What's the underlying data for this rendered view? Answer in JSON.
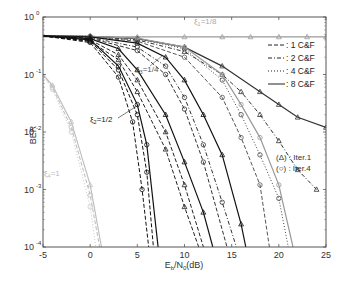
{
  "chart_data": {
    "type": "line",
    "title": "",
    "xlabel": "E_b/N_0(dB)",
    "ylabel": "BER",
    "xlim": [
      -5,
      25
    ],
    "ylim": [
      0.0001,
      1
    ],
    "yscale": "log",
    "grid": false,
    "x_ticks": [
      -5,
      0,
      5,
      10,
      15,
      20,
      25
    ],
    "x_tick_labels": [
      "-5",
      "0",
      "5",
      "10",
      "15",
      "20",
      "25"
    ],
    "y_ticks": [
      1,
      0.1,
      0.01,
      0.001,
      0.0001
    ],
    "y_tick_labels": [
      {
        "base": "10",
        "exp": "0"
      },
      {
        "base": "10",
        "exp": "-1"
      },
      {
        "base": "10",
        "exp": "-2"
      },
      {
        "base": "10",
        "exp": "-3"
      },
      {
        "base": "10",
        "exp": "-4"
      }
    ],
    "legend": {
      "position": "right",
      "entries": [
        {
          "style": "dashed",
          "label": ": 1 C&F"
        },
        {
          "style": "dashdot",
          "label": ": 2 C&F"
        },
        {
          "style": "dotted",
          "label": ": 4 C&F"
        },
        {
          "style": "solid",
          "label": ": 8 C&F"
        }
      ]
    },
    "marker_legend": [
      {
        "marker": "triangle",
        "label": "(Δ) : Iter.1"
      },
      {
        "marker": "circle",
        "label": "(○) : Iter.4"
      }
    ],
    "annotations": [
      {
        "text": "ξ",
        "sub": "1",
        "rest": "=1/8",
        "color": "#aaaaaa"
      },
      {
        "text": "ξ",
        "sub": "3",
        "rest": "=1/4",
        "color": "#555555"
      },
      {
        "text": "ξ",
        "sub": "2",
        "rest": "=1/2",
        "color": "#222222"
      },
      {
        "text": "ξ",
        "sub": "4",
        "rest": "=1",
        "color": "#bbbbbb"
      }
    ],
    "series": [
      {
        "name": "xi1=1/8 all C&F (error floor)",
        "color": "#999999",
        "style": "solid",
        "marker": "triangle",
        "x": [
          -5,
          0,
          5,
          10,
          14,
          17,
          20,
          23,
          25
        ],
        "y": [
          0.45,
          0.45,
          0.45,
          0.45,
          0.45,
          0.45,
          0.45,
          0.45,
          0.45
        ]
      },
      {
        "name": "xi1=1/8 8C&F Iter1",
        "color": "#333333",
        "style": "solid",
        "marker": "triangle",
        "x": [
          -5,
          0,
          5,
          10,
          14,
          18,
          20,
          22,
          25
        ],
        "y": [
          0.47,
          0.46,
          0.42,
          0.3,
          0.14,
          0.05,
          0.03,
          0.018,
          0.012
        ]
      },
      {
        "name": "xi1=1/8 2C&F Iter1",
        "color": "#333333",
        "style": "dashdot",
        "marker": "triangle",
        "x": [
          -5,
          0,
          5,
          10,
          14,
          16,
          18,
          20,
          22,
          24
        ],
        "y": [
          0.47,
          0.46,
          0.4,
          0.25,
          0.1,
          0.05,
          0.02,
          0.007,
          0.0022,
          0.001
        ]
      },
      {
        "name": "xi1=1/8 4C&F Iter4",
        "color": "#444444",
        "style": "dotted",
        "marker": "circle",
        "x": [
          -5,
          0,
          5,
          10,
          14,
          16,
          18,
          20,
          21
        ],
        "y": [
          0.47,
          0.46,
          0.42,
          0.28,
          0.08,
          0.02,
          0.004,
          0.0007,
          0.0001
        ]
      },
      {
        "name": "xi1=1/8 1C&F Iter4",
        "color": "#555555",
        "style": "dashed",
        "marker": "circle",
        "x": [
          -5,
          0,
          5,
          10,
          14,
          16,
          18,
          19
        ],
        "y": [
          0.47,
          0.45,
          0.38,
          0.2,
          0.04,
          0.008,
          0.0012,
          0.0001
        ]
      },
      {
        "name": "xi1=1/8 8C&F Iter4",
        "color": "#999999",
        "style": "solid",
        "marker": "circle",
        "x": [
          -5,
          0,
          5,
          10,
          14,
          16,
          18,
          20,
          21.5
        ],
        "y": [
          0.47,
          0.46,
          0.43,
          0.3,
          0.1,
          0.03,
          0.008,
          0.0012,
          0.0001
        ]
      },
      {
        "name": "xi3=1/4 8C&F",
        "color": "#111111",
        "style": "solid",
        "marker": "triangle",
        "x": [
          -5,
          0,
          5,
          8,
          10,
          12,
          14,
          16,
          16.5
        ],
        "y": [
          0.47,
          0.45,
          0.35,
          0.2,
          0.08,
          0.02,
          0.004,
          0.00025,
          0.0001
        ]
      },
      {
        "name": "xi3=1/4 2C&F",
        "color": "#333333",
        "style": "dashdot",
        "marker": "circle",
        "x": [
          -5,
          0,
          5,
          8,
          10,
          12,
          14,
          15.5
        ],
        "y": [
          0.47,
          0.44,
          0.3,
          0.14,
          0.04,
          0.006,
          0.0006,
          0.0001
        ]
      },
      {
        "name": "xi3=1/4 1C&F",
        "color": "#333333",
        "style": "dashed",
        "marker": "circle",
        "x": [
          -5,
          0,
          5,
          8,
          10,
          12,
          14.5
        ],
        "y": [
          0.47,
          0.43,
          0.26,
          0.1,
          0.025,
          0.003,
          0.0001
        ]
      },
      {
        "name": "xi2=1/2 8C&F",
        "color": "#111111",
        "style": "solid",
        "marker": "triangle",
        "x": [
          -5,
          0,
          3,
          5,
          8,
          10,
          12,
          13
        ],
        "y": [
          0.47,
          0.42,
          0.28,
          0.12,
          0.02,
          0.003,
          0.0004,
          0.0001
        ]
      },
      {
        "name": "xi2=1/2 2C&F",
        "color": "#222222",
        "style": "dashed",
        "marker": "triangle",
        "x": [
          -5,
          0,
          3,
          5,
          8,
          10,
          12
        ],
        "y": [
          0.47,
          0.4,
          0.22,
          0.08,
          0.01,
          0.0012,
          0.0001
        ]
      },
      {
        "name": "xi2=1/2 1C&F",
        "color": "#222222",
        "style": "dashed",
        "marker": "triangle",
        "x": [
          -5,
          0,
          3,
          5,
          8,
          10,
          11.5
        ],
        "y": [
          0.47,
          0.38,
          0.18,
          0.05,
          0.005,
          0.0005,
          0.0001
        ]
      },
      {
        "name": "xi2=1/2 8C&F Iter4",
        "color": "#111111",
        "style": "solid",
        "marker": "circle",
        "x": [
          -5,
          0,
          3,
          5,
          6,
          7.2
        ],
        "y": [
          0.47,
          0.4,
          0.14,
          0.03,
          0.006,
          0.0001
        ]
      },
      {
        "name": "xi2=1/2 2C&F Iter4",
        "color": "#111111",
        "style": "dashed",
        "marker": "circle",
        "x": [
          -5,
          0,
          3,
          5,
          6,
          6.7
        ],
        "y": [
          0.47,
          0.38,
          0.12,
          0.02,
          0.002,
          0.0001
        ]
      },
      {
        "name": "xi2=1/2 1C&F Iter4",
        "color": "#111111",
        "style": "dashed",
        "marker": "circle",
        "x": [
          -5,
          0,
          3,
          4.5,
          5.5,
          6.2
        ],
        "y": [
          0.47,
          0.36,
          0.09,
          0.015,
          0.001,
          0.0001
        ]
      },
      {
        "name": "xi4=1 curves",
        "color": "#bbbbbb",
        "style": "dashed",
        "marker": "circle",
        "x": [
          -5,
          -4,
          -2,
          0,
          1
        ],
        "y": [
          0.1,
          0.06,
          0.012,
          0.0008,
          0.0001
        ]
      },
      {
        "name": "xi4=1 curves b",
        "color": "#c0c0c0",
        "style": "solid",
        "marker": "triangle",
        "x": [
          -5,
          -4,
          -2,
          0,
          1.2
        ],
        "y": [
          0.1,
          0.065,
          0.015,
          0.0012,
          0.0001
        ]
      },
      {
        "name": "xi4=1 curves c",
        "color": "#c8c8c8",
        "style": "dotted",
        "marker": "circle",
        "x": [
          -5,
          -4,
          -2,
          0,
          0.6
        ],
        "y": [
          0.1,
          0.055,
          0.01,
          0.0005,
          0.0001
        ]
      }
    ]
  }
}
